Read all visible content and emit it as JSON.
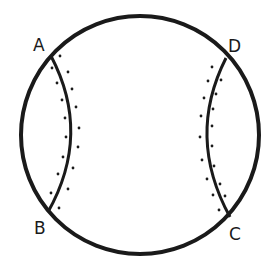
{
  "diagram": {
    "stroke_color": "#1a1a1a",
    "background": "#ffffff",
    "circle": {
      "cx": 140,
      "cy": 135,
      "r": 119
    },
    "points": [
      {
        "id": "A",
        "label": "A",
        "x": 51,
        "y": 56,
        "label_x": 33,
        "label_y": 51
      },
      {
        "id": "D",
        "label": "D",
        "x": 226,
        "y": 58,
        "label_x": 228,
        "label_y": 52
      },
      {
        "id": "B",
        "label": "B",
        "x": 48,
        "y": 212,
        "label_x": 34,
        "label_y": 234
      },
      {
        "id": "C",
        "label": "C",
        "x": 230,
        "y": 217,
        "label_x": 229,
        "label_y": 240
      }
    ],
    "seams": [
      {
        "id": "seam-left",
        "from": "A",
        "to": "B",
        "path": "M51,56 Q92,134 48,212"
      },
      {
        "id": "seam-right",
        "from": "D",
        "to": "C",
        "path": "M226,58 Q186,137 230,217"
      }
    ],
    "stitches_left": [
      [
        60,
        56
      ],
      [
        52,
        68
      ],
      [
        68,
        72
      ],
      [
        57,
        83
      ],
      [
        72,
        89
      ],
      [
        62,
        100
      ],
      [
        76,
        107
      ],
      [
        65,
        118
      ],
      [
        79,
        128
      ],
      [
        66,
        137
      ],
      [
        78,
        147
      ],
      [
        63,
        157
      ],
      [
        73,
        168
      ],
      [
        58,
        174
      ],
      [
        68,
        189
      ],
      [
        51,
        193
      ],
      [
        59,
        208
      ]
    ],
    "stitches_right": [
      [
        212,
        67
      ],
      [
        208,
        81
      ],
      [
        221,
        80
      ],
      [
        204,
        98
      ],
      [
        216,
        94
      ],
      [
        213,
        109
      ],
      [
        201,
        116
      ],
      [
        212,
        126
      ],
      [
        200,
        137
      ],
      [
        212,
        146
      ],
      [
        202,
        160
      ],
      [
        214,
        166
      ],
      [
        207,
        179
      ],
      [
        220,
        184
      ],
      [
        213,
        195
      ],
      [
        225,
        196
      ],
      [
        219,
        210
      ]
    ]
  }
}
